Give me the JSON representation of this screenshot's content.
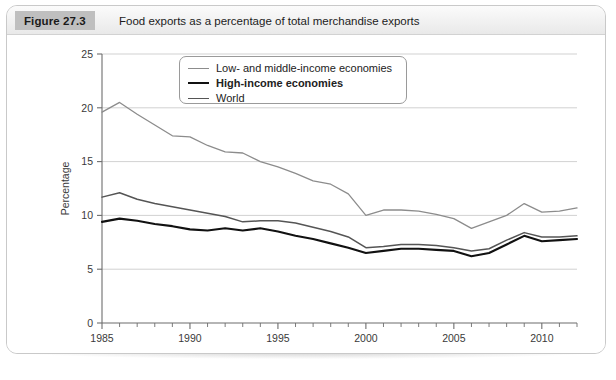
{
  "figure": {
    "badge": "Figure 27.3",
    "title": "Food exports as a percentage of total merchandise exports"
  },
  "legend": {
    "items": [
      {
        "label": "Low- and middle-income economies",
        "color": "#8c8c8c",
        "width": 1.3,
        "bold": false
      },
      {
        "label": "High-income economies",
        "color": "#111111",
        "width": 2.1,
        "bold": true
      },
      {
        "label": "World",
        "color": "#555555",
        "width": 1.5,
        "bold": false
      }
    ]
  },
  "chart_data": {
    "type": "line",
    "title": "Food exports as a percentage of total merchandise exports",
    "xlabel": "",
    "ylabel": "Percentage",
    "xlim": [
      1985,
      2012
    ],
    "ylim": [
      0,
      25
    ],
    "yticks": [
      0,
      5,
      10,
      15,
      20,
      25
    ],
    "xticks": [
      1985,
      1990,
      1995,
      2000,
      2005,
      2010
    ],
    "xtick_minor_step": 1,
    "grid": "horizontal",
    "legend_position": "top-center",
    "x": [
      1985,
      1986,
      1987,
      1988,
      1989,
      1990,
      1991,
      1992,
      1993,
      1994,
      1995,
      1996,
      1997,
      1998,
      1999,
      2000,
      2001,
      2002,
      2003,
      2004,
      2005,
      2006,
      2007,
      2008,
      2009,
      2010,
      2011,
      2012
    ],
    "series": [
      {
        "name": "Low- and middle-income economies",
        "color": "#8c8c8c",
        "width": 1.3,
        "values": [
          19.6,
          20.5,
          19.4,
          18.4,
          17.4,
          17.3,
          16.5,
          15.9,
          15.8,
          15.0,
          14.5,
          13.9,
          13.2,
          12.9,
          12.0,
          10.0,
          10.5,
          10.5,
          10.4,
          10.1,
          9.7,
          8.8,
          9.4,
          10.0,
          11.1,
          10.3,
          10.4,
          10.7
        ]
      },
      {
        "name": "World",
        "color": "#555555",
        "width": 1.5,
        "values": [
          11.7,
          12.1,
          11.5,
          11.1,
          10.8,
          10.5,
          10.2,
          9.9,
          9.4,
          9.5,
          9.5,
          9.3,
          8.9,
          8.5,
          8.0,
          7.0,
          7.1,
          7.3,
          7.3,
          7.2,
          7.0,
          6.7,
          6.9,
          7.7,
          8.4,
          8.0,
          8.0,
          8.1
        ]
      },
      {
        "name": "High-income economies",
        "color": "#111111",
        "width": 2.1,
        "values": [
          9.4,
          9.7,
          9.5,
          9.2,
          9.0,
          8.7,
          8.6,
          8.8,
          8.6,
          8.8,
          8.5,
          8.1,
          7.8,
          7.4,
          7.0,
          6.5,
          6.7,
          6.9,
          6.9,
          6.8,
          6.7,
          6.2,
          6.5,
          7.3,
          8.1,
          7.6,
          7.7,
          7.8
        ]
      }
    ]
  }
}
